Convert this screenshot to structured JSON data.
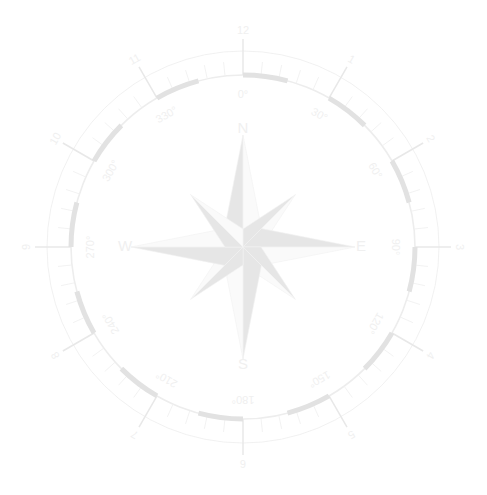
{
  "image": {
    "title": "Nautical Compass Rose Watermark",
    "width": 487,
    "height": 495,
    "background_color": "#ffffff",
    "style": "very faint grayscale watermark"
  },
  "compass": {
    "center_x": 243,
    "center_y": 247,
    "colors": {
      "background": "#ffffff",
      "ring_line": "#ededed",
      "ring_band_dark": "#e2e2e2",
      "tick_major": "#e8e8e8",
      "tick_minor": "#f0f0f0",
      "label_text": "#f0f0f0",
      "star_light": "#fafafa",
      "star_dark": "#e6e6e6",
      "star_outline": "#f2f2f2"
    },
    "radii": {
      "outer_hour_ring": 216,
      "tick_ring_outer": 196,
      "main_ring": 172,
      "degree_label_ring": 152,
      "cardinal_label_ring": 118,
      "star_major_point": 112,
      "star_minor_point": 74
    },
    "cardinals": [
      {
        "label": "N",
        "angle_deg": 0
      },
      {
        "label": "E",
        "angle_deg": 90
      },
      {
        "label": "S",
        "angle_deg": 180
      },
      {
        "label": "W",
        "angle_deg": 270
      }
    ],
    "degree_labels": [
      {
        "label": "0°",
        "angle_deg": 0
      },
      {
        "label": "30°",
        "angle_deg": 30
      },
      {
        "label": "60°",
        "angle_deg": 60
      },
      {
        "label": "90°",
        "angle_deg": 90
      },
      {
        "label": "120°",
        "angle_deg": 120
      },
      {
        "label": "150°",
        "angle_deg": 150
      },
      {
        "label": "180°",
        "angle_deg": 180
      },
      {
        "label": "210°",
        "angle_deg": 210
      },
      {
        "label": "240°",
        "angle_deg": 240
      },
      {
        "label": "270°",
        "angle_deg": 270
      },
      {
        "label": "300°",
        "angle_deg": 300
      },
      {
        "label": "330°",
        "angle_deg": 330
      }
    ],
    "hour_labels": [
      {
        "label": "12",
        "angle_deg": 0
      },
      {
        "label": "1",
        "angle_deg": 30
      },
      {
        "label": "2",
        "angle_deg": 60
      },
      {
        "label": "3",
        "angle_deg": 90
      },
      {
        "label": "4",
        "angle_deg": 120
      },
      {
        "label": "5",
        "angle_deg": 150
      },
      {
        "label": "6",
        "angle_deg": 180
      },
      {
        "label": "7",
        "angle_deg": 210
      },
      {
        "label": "8",
        "angle_deg": 240
      },
      {
        "label": "9",
        "angle_deg": 270
      },
      {
        "label": "10",
        "angle_deg": 300
      },
      {
        "label": "11",
        "angle_deg": 330
      }
    ],
    "graduation": {
      "minor_step_deg": 6,
      "major_step_deg": 30,
      "band_arc_span_deg": 15
    },
    "star": {
      "points": 8,
      "point_labels": [
        "N",
        "NE",
        "E",
        "SE",
        "S",
        "SW",
        "W",
        "NW"
      ]
    }
  }
}
